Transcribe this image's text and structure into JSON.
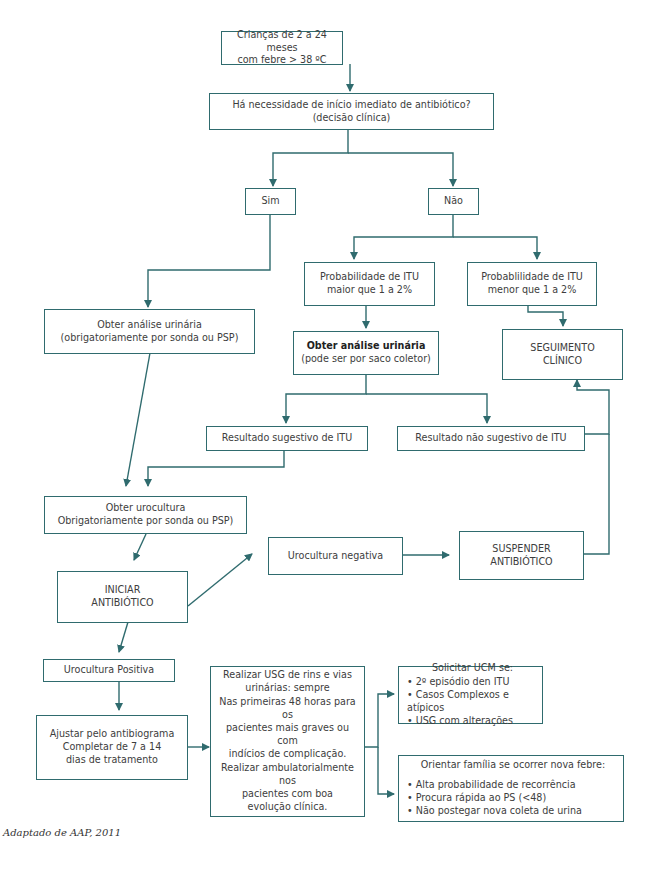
{
  "diagram": {
    "colors": {
      "line": "#2f6b6e",
      "text": "#3d3d3d",
      "background": "#ffffff"
    },
    "nodes": {
      "start": {
        "lines": [
          "Crianças de 2 a 24 meses",
          "com febre > 38 ºC"
        ]
      },
      "decision": {
        "lines": [
          "Há necessidade de início imediato de antibiótico?",
          "(decisão clínica)"
        ]
      },
      "sim": {
        "label": "Sim"
      },
      "nao": {
        "label": "Não"
      },
      "prob_maior": {
        "lines": [
          "Probabilidade de ITU",
          "maior que 1 a 2%"
        ]
      },
      "prob_menor": {
        "lines": [
          "Probablilidade de ITU",
          "menor que 1 a 2%"
        ]
      },
      "analise_sonda": {
        "lines": [
          "Obter análise urinária",
          "(obrigatoriamente por sonda ou PSP)"
        ]
      },
      "analise_saco": {
        "title": "Obter análise urinária",
        "subtitle": "(pode ser por saco coletor)"
      },
      "seguimento": {
        "lines": [
          "SEGUIMENTO",
          "CLÍNICO"
        ]
      },
      "resultado_sugestivo": {
        "label": "Resultado sugestivo de ITU"
      },
      "resultado_nao_sugestivo": {
        "label": "Resultado não sugestivo de ITU"
      },
      "urocultura": {
        "lines": [
          "Obter urocultura",
          "Obrigatoriamente por sonda ou PSP)"
        ]
      },
      "iniciar": {
        "lines": [
          "INICIAR",
          "ANTIBIÓTICO"
        ]
      },
      "urocultura_negativa": {
        "label": "Urocultura negativa"
      },
      "suspender": {
        "lines": [
          "SUSPENDER",
          "ANTIBIÓTICO"
        ]
      },
      "urocultura_positiva": {
        "label": "Urocultura Positiva"
      },
      "ajustar": {
        "lines": [
          "Ajustar pelo antibiograma",
          "Completar de 7 a 14",
          "dias de tratamento"
        ]
      },
      "usg": {
        "para1": [
          "Realizar USG de rins e vias",
          "urinárias: sempre"
        ],
        "para2": [
          "Nas primeiras 48 horas para os",
          "pacientes mais graves ou com",
          "indícios de complicação."
        ],
        "para3": [
          "Realizar ambulatorialmente nos",
          "pacientes com boa",
          "evolução clínica."
        ]
      },
      "ucm": {
        "title": "Solicitar UCM se:",
        "items": [
          "2º episódio den ITU",
          "Casos Complexos e atípicos",
          "USG com alterações"
        ]
      },
      "orientar": {
        "title": "Orientar família se ocorrer nova febre:",
        "items": [
          "Alta probabilidade de recorrência",
          "Procura rápida ao PS (<48)",
          "Não postegar nova coleta de urina"
        ]
      }
    },
    "footnote": "Adaptado de AAP, 2011"
  }
}
